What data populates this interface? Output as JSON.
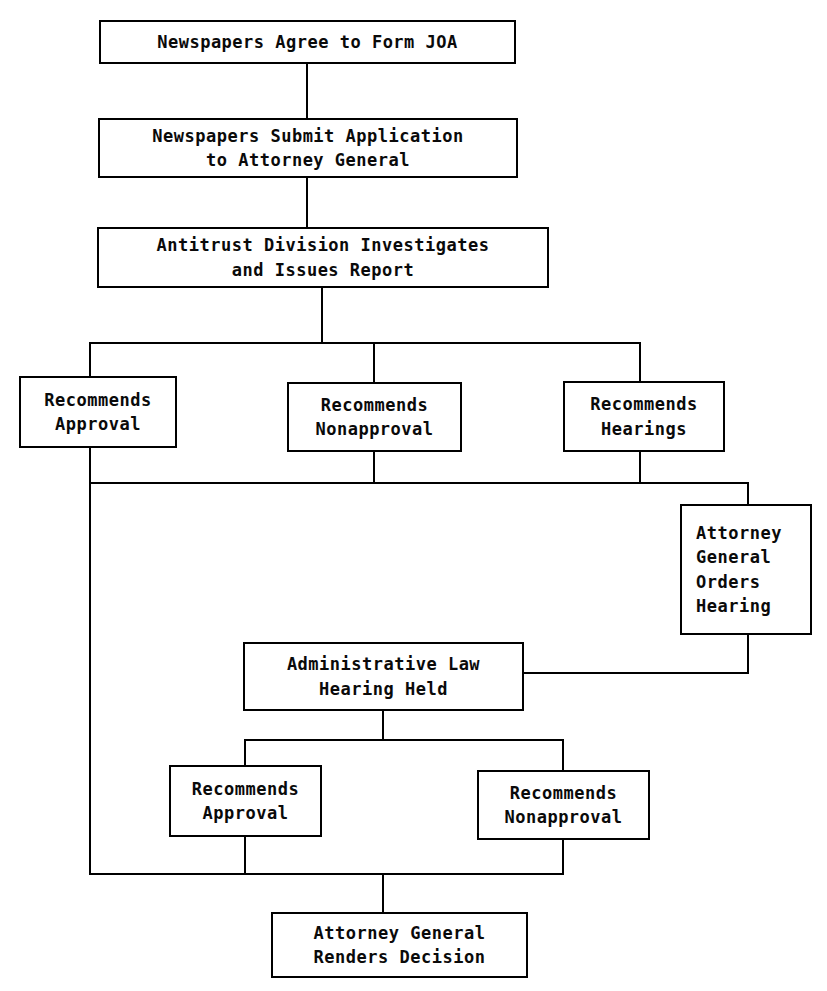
{
  "diagram": {
    "canvas": {
      "width": 827,
      "height": 991
    },
    "style": {
      "line_color": "#000000",
      "box_border_color": "#000000",
      "box_fill_color": "#ffffff",
      "background_color": "#ffffff",
      "text_color": "#0a0a0a",
      "line_width": 2
    },
    "nodes": [
      {
        "id": "newspapers-agree",
        "label": "Newspapers Agree to Form JOA",
        "lines": [
          "Newspapers Agree to Form JOA"
        ],
        "x": 99,
        "y": 20,
        "w": 417,
        "h": 44,
        "align": "center"
      },
      {
        "id": "newspapers-submit",
        "label": "Newspapers Submit Application to Attorney General",
        "lines": [
          "Newspapers Submit Application",
          "to Attorney General"
        ],
        "x": 98,
        "y": 118,
        "w": 420,
        "h": 60,
        "align": "center"
      },
      {
        "id": "antitrust-division",
        "label": "Antitrust Division Investigates and Issues Report",
        "lines": [
          "Antitrust Division Investigates",
          "and Issues Report"
        ],
        "x": 97,
        "y": 227,
        "w": 452,
        "h": 61,
        "align": "center"
      },
      {
        "id": "recommends-approval-1",
        "label": "Recommends Approval",
        "lines": [
          "Recommends",
          "Approval"
        ],
        "x": 19,
        "y": 376,
        "w": 158,
        "h": 72,
        "align": "center"
      },
      {
        "id": "recommends-nonapproval-1",
        "label": "Recommends Nonapproval",
        "lines": [
          "Recommends",
          "Nonapproval"
        ],
        "x": 287,
        "y": 382,
        "w": 175,
        "h": 70,
        "align": "center"
      },
      {
        "id": "recommends-hearings",
        "label": "Recommends Hearings",
        "lines": [
          "Recommends",
          "Hearings"
        ],
        "x": 563,
        "y": 381,
        "w": 162,
        "h": 71,
        "align": "center"
      },
      {
        "id": "attorney-general-orders-hearing",
        "label": "Attorney General Orders Hearing",
        "lines": [
          "Attorney",
          "General",
          "Orders",
          "Hearing"
        ],
        "x": 680,
        "y": 504,
        "w": 132,
        "h": 131,
        "align": "left"
      },
      {
        "id": "administrative-law-hearing",
        "label": "Administrative Law Hearing Held",
        "lines": [
          "Administrative Law",
          "Hearing Held"
        ],
        "x": 243,
        "y": 642,
        "w": 281,
        "h": 69,
        "align": "center"
      },
      {
        "id": "recommends-approval-2",
        "label": "Recommends Approval",
        "lines": [
          "Recommends",
          "Approval"
        ],
        "x": 169,
        "y": 765,
        "w": 153,
        "h": 72,
        "align": "center"
      },
      {
        "id": "recommends-nonapproval-2",
        "label": "Recommends Nonapproval",
        "lines": [
          "Recommends",
          "Nonapproval"
        ],
        "x": 477,
        "y": 770,
        "w": 173,
        "h": 70,
        "align": "center"
      },
      {
        "id": "attorney-general-renders-decision",
        "label": "Attorney General Renders Decision",
        "lines": [
          "Attorney General",
          "Renders Decision"
        ],
        "x": 271,
        "y": 912,
        "w": 257,
        "h": 66,
        "align": "center"
      }
    ],
    "connectors": [
      {
        "id": "c-agree-to-submit",
        "points": "307,64 307,118"
      },
      {
        "id": "c-submit-to-antitrust",
        "points": "307,178 307,227"
      },
      {
        "id": "c-antitrust-to-branchbar",
        "points": "322,288 322,343"
      },
      {
        "id": "c-branch-bar",
        "points": "90,343 640,343"
      },
      {
        "id": "c-branch-to-approval1",
        "points": "90,343 90,376"
      },
      {
        "id": "c-branch-to-nonapproval1",
        "points": "374,343 374,382"
      },
      {
        "id": "c-branch-to-hearings",
        "points": "640,343 640,381"
      },
      {
        "id": "c-approval1-down",
        "points": "90,448 90,874"
      },
      {
        "id": "c-nonapproval1-down",
        "points": "374,452 374,483"
      },
      {
        "id": "c-hearings-down",
        "points": "640,452 640,483"
      },
      {
        "id": "c-merge-bar",
        "points": "90,483 748,483"
      },
      {
        "id": "c-merge-to-agorders",
        "points": "748,483 748,504"
      },
      {
        "id": "c-agorders-down",
        "points": "748,635 748,673"
      },
      {
        "id": "c-agorders-to-alj",
        "points": "748,673 524,673"
      },
      {
        "id": "c-alj-down",
        "points": "383,711 383,740"
      },
      {
        "id": "c-alj-split-bar",
        "points": "245,740 563,740"
      },
      {
        "id": "c-alj-to-approval2",
        "points": "245,740 245,765"
      },
      {
        "id": "c-alj-to-nonapproval2",
        "points": "563,740 563,770"
      },
      {
        "id": "c-approval2-down",
        "points": "245,837 245,874"
      },
      {
        "id": "c-nonapproval2-down",
        "points": "563,840 563,874"
      },
      {
        "id": "c-bottom-merge-bar",
        "points": "90,874 563,874"
      },
      {
        "id": "c-bottom-to-decision",
        "points": "383,874 383,912"
      }
    ]
  }
}
